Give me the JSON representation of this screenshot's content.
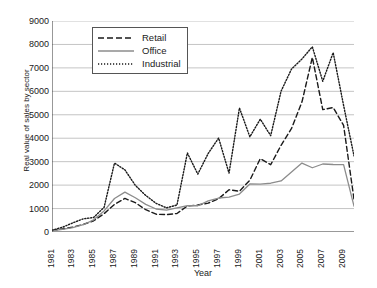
{
  "chart_data": {
    "type": "line",
    "title": "",
    "xlabel": "Year",
    "ylabel": "Real value of sales by sector",
    "ylim": [
      0,
      9000
    ],
    "ytick_values": [
      0,
      1000,
      2000,
      3000,
      4000,
      5000,
      6000,
      7000,
      8000,
      9000
    ],
    "ytick_labels": [
      "0",
      "1000",
      "2000",
      "3000",
      "4000",
      "5000",
      "6000",
      "7000",
      "8000",
      "9000"
    ],
    "grid": "horizontal",
    "legend_position": "top-left-inside",
    "x": [
      1981,
      1982,
      1983,
      1984,
      1985,
      1986,
      1987,
      1988,
      1989,
      1990,
      1991,
      1992,
      1993,
      1994,
      1995,
      1996,
      1997,
      1998,
      1999,
      2000,
      2001,
      2002,
      2003,
      2004,
      2005,
      2006,
      2007,
      2008,
      2009,
      2010
    ],
    "xtick_labels": [
      "1981",
      "1983",
      "1985",
      "1987",
      "1989",
      "1991",
      "1993",
      "1995",
      "1997",
      "1999",
      "2001",
      "2003",
      "2005",
      "2007",
      "2009"
    ],
    "series": [
      {
        "name": "Retail",
        "style": "dashed",
        "color": "#1a1a1a",
        "values": [
          60,
          130,
          210,
          320,
          480,
          780,
          1180,
          1430,
          1250,
          950,
          760,
          740,
          790,
          1110,
          1150,
          1230,
          1420,
          1800,
          1740,
          2210,
          3130,
          2870,
          3700,
          4420,
          5540,
          7450,
          5220,
          5310,
          4550,
          1400
        ]
      },
      {
        "name": "Office",
        "style": "solid",
        "color": "#8c8c8c",
        "values": [
          50,
          110,
          190,
          310,
          520,
          900,
          1430,
          1700,
          1460,
          1180,
          980,
          930,
          1030,
          1120,
          1120,
          1330,
          1450,
          1490,
          1620,
          2050,
          2040,
          2080,
          2180,
          2560,
          2940,
          2740,
          2900,
          2880,
          2870,
          1100
        ]
      },
      {
        "name": "Industrial",
        "style": "dotted",
        "color": "#1a1a1a",
        "values": [
          80,
          200,
          390,
          560,
          620,
          1050,
          2940,
          2650,
          1990,
          1560,
          1220,
          1030,
          1150,
          3370,
          2470,
          3350,
          4010,
          2510,
          5290,
          4060,
          4810,
          4110,
          6010,
          6950,
          7380,
          7900,
          6430,
          7650,
          5400,
          3250
        ]
      }
    ]
  },
  "legend": {
    "items": [
      {
        "label": "Retail"
      },
      {
        "label": "Office"
      },
      {
        "label": "Industrial"
      }
    ]
  }
}
